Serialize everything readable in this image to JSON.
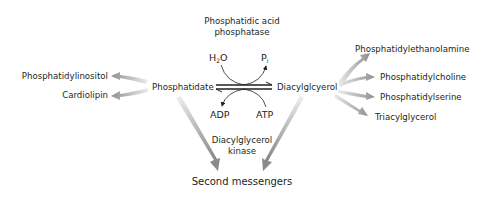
{
  "enzymes": {
    "top": {
      "line1": "Phosphatidic acid",
      "line2": "phosphatase"
    },
    "bottom": {
      "line1": "Diacylglycerol",
      "line2": "kinase"
    }
  },
  "cofactors": {
    "top_left_main": "H",
    "top_left_sub": "2",
    "top_left_tail": "O",
    "top_right_main": "P",
    "top_right_sub": "i",
    "bottom_left": "ADP",
    "bottom_right": "ATP"
  },
  "central": {
    "left": "Phosphatidate",
    "right": "Diacylglcyerol"
  },
  "left_products": [
    "Phosphatidylinositol",
    "Cardiolipin"
  ],
  "right_products": [
    "Phosphatidylethanolamine",
    "Phosphatidylcholine",
    "Phosphatidylserine",
    "Triacylglycerol"
  ],
  "bottom_product": "Second messengers",
  "colors": {
    "text": "#231f20",
    "arrow_gray": "#9a9a9a",
    "arrow_light": "#e6e6e6"
  }
}
